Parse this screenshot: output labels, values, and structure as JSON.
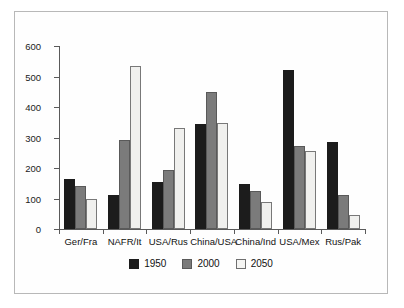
{
  "chart_data": {
    "type": "bar",
    "title": "",
    "xlabel": "",
    "ylabel": "",
    "ylim": [
      0,
      600
    ],
    "yticks": [
      0,
      100,
      200,
      300,
      400,
      500,
      600
    ],
    "grid": false,
    "legend_position": "bottom",
    "categories": [
      "Ger/Fra",
      "NAFR/It",
      "USA/Rus",
      "China/USA",
      "China/Ind",
      "USA/Mex",
      "Rus/Pak"
    ],
    "series": [
      {
        "name": "1950",
        "color": "#1c1c1c",
        "values": [
          164,
          110,
          154,
          343,
          148,
          523,
          284
        ]
      },
      {
        "name": "2000",
        "color": "#7b7b7b",
        "values": [
          141,
          292,
          194,
          450,
          125,
          272,
          112
        ]
      },
      {
        "name": "2050",
        "color": "#f0f0ee",
        "values": [
          99,
          534,
          332,
          348,
          89,
          257,
          46
        ]
      }
    ]
  },
  "legend": {
    "items": [
      {
        "label": "1950"
      },
      {
        "label": "2000"
      },
      {
        "label": "2050"
      }
    ]
  }
}
